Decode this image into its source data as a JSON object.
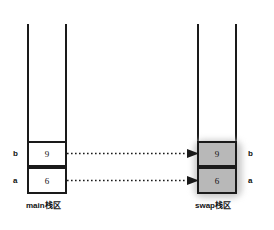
{
  "diagram": {
    "title_left": "main栈区",
    "title_right": "swap栈区",
    "colors": {
      "line": "#1a1a1a",
      "cell_fill_left": "#ffffff",
      "cell_fill_right": "#b8b8b8",
      "shadow": "#c9c9c9",
      "background": "#ffffff"
    }
  },
  "left_stack": {
    "caption": "main栈区",
    "cells": [
      {
        "label": "b",
        "value": "9"
      },
      {
        "label": "a",
        "value": "6"
      }
    ]
  },
  "right_stack": {
    "caption": "swap栈区",
    "cells": [
      {
        "label": "b",
        "value": "9"
      },
      {
        "label": "a",
        "value": "6"
      }
    ]
  },
  "arrows": [
    {
      "name": "copy-b",
      "style": "dotted"
    },
    {
      "name": "copy-a",
      "style": "dotted"
    }
  ]
}
